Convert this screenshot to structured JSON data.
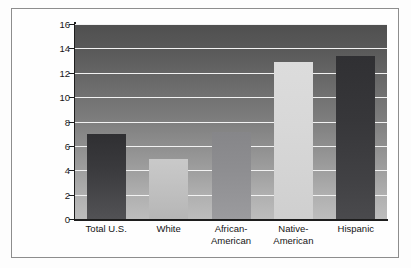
{
  "chart_data": {
    "type": "bar",
    "title": "",
    "subtitle": "",
    "xlabel": "",
    "ylabel": "Percentage of 16- to 24-Year-Olds Without a High School Diploma or GED",
    "ylabel_line1": "Percentage of 16- to 24-Year-Olds",
    "ylabel_line2": "Without a High School Diploma or GED",
    "categories": [
      "Total U.S.",
      "White",
      "African-American",
      "Native-American",
      "Hispanic"
    ],
    "category_lines": [
      [
        "Total U.S."
      ],
      [
        "White"
      ],
      [
        "African-",
        "American"
      ],
      [
        "Native-",
        "American"
      ],
      [
        "Hispanic"
      ]
    ],
    "values": [
      7.0,
      4.9,
      7.1,
      12.9,
      13.4
    ],
    "ylim": [
      0,
      16
    ],
    "ytick_labels": [
      "0",
      "2",
      "4",
      "6",
      "8",
      "10",
      "12",
      "14",
      "16"
    ],
    "ytick_values": [
      0,
      2,
      4,
      6,
      8,
      10,
      12,
      14,
      16
    ],
    "grid": true,
    "gridline_color": "#f2f2f2",
    "legend": "none",
    "bar_colors": [
      "#3a3a3d",
      "#c3c3c3",
      "#8d8d90",
      "#d8d8d8",
      "#37373a"
    ],
    "plot_background": "vertical gray gradient, dark at top to light at bottom",
    "axis_color": "#1d1d1d"
  }
}
